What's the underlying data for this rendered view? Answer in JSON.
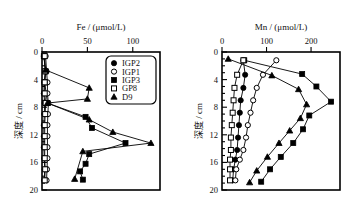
{
  "figure": {
    "panels": [
      {
        "id": "fe",
        "x_axis_title": "Fe / (μmol/L)",
        "y_axis_title": "深度 / cm",
        "x_ticks": [
          0,
          50,
          100
        ],
        "x_range": [
          0,
          130
        ],
        "y_ticks": [
          0,
          4,
          8,
          12,
          16,
          20
        ],
        "y_range": [
          0,
          20
        ],
        "has_legend": true
      },
      {
        "id": "mn",
        "x_axis_title": "Mn / (μmol/L)",
        "y_axis_title": "深度 / cm",
        "x_ticks": [
          0,
          100,
          200
        ],
        "x_range": [
          0,
          265
        ],
        "y_ticks": [
          0,
          4,
          8,
          12,
          16,
          20
        ],
        "has_legend": false
      }
    ]
  },
  "legend": {
    "entries": [
      {
        "label": "IGP2",
        "marker": "filled-circle"
      },
      {
        "label": "IGP1",
        "marker": "open-circle"
      },
      {
        "label": "IGP3",
        "marker": "filled-square"
      },
      {
        "label": "GP8",
        "marker": "open-square"
      },
      {
        "label": "D9",
        "marker": "filled-triangle"
      }
    ]
  },
  "chart_data": [
    {
      "type": "line",
      "id": "fe-profile",
      "title": "Fe / (μmol/L)",
      "xlabel": "Fe / (μmol/L)",
      "ylabel": "深度 / cm",
      "xlim": [
        0,
        130
      ],
      "ylim": [
        20,
        0
      ],
      "y_inverted": true,
      "grid": false,
      "legend_position": "top-right",
      "x_ticks": [
        0,
        50,
        100
      ],
      "y_ticks": [
        0,
        4,
        8,
        12,
        16,
        20
      ],
      "series": [
        {
          "name": "IGP2",
          "marker": "filled-circle",
          "depth_cm": [
            0.6,
            2.8,
            4.4,
            6.0,
            7.4,
            9.0,
            10.6,
            12.2,
            13.8,
            15.4,
            17.0,
            18.6
          ],
          "values": [
            2.0,
            4.0,
            2.5,
            2.0,
            3.0,
            2.5,
            2.0,
            2.0,
            2.0,
            2.5,
            3.0,
            2.5
          ]
        },
        {
          "name": "IGP1",
          "marker": "open-circle",
          "depth_cm": [
            0.6,
            2.8,
            4.4,
            6.0,
            7.4,
            9.0,
            10.6,
            12.2,
            13.8,
            15.4,
            17.0,
            18.6
          ],
          "values": [
            4.0,
            5.0,
            6.0,
            6.0,
            7.0,
            6.5,
            6.0,
            6.0,
            6.0,
            6.0,
            5.5,
            5.0
          ]
        },
        {
          "name": "IGP3",
          "marker": "filled-square",
          "depth_cm": [
            0.6,
            2.8,
            4.4,
            7.4,
            9.4,
            11.0,
            13.2,
            14.8,
            16.2,
            17.3,
            18.5
          ],
          "values": [
            2.0,
            4.0,
            3.0,
            6.0,
            48.0,
            55.0,
            92.0,
            52.0,
            48.0,
            42.0,
            45.0
          ]
        },
        {
          "name": "GP8",
          "marker": "open-square",
          "depth_cm": [
            0.6,
            2.8,
            4.4,
            6.0,
            7.4,
            9.0,
            10.6,
            12.2,
            13.8,
            15.4,
            17.0,
            18.6
          ],
          "values": [
            3.0,
            3.5,
            3.0,
            3.0,
            4.0,
            3.5,
            3.0,
            3.0,
            3.0,
            3.0,
            3.5,
            3.0
          ]
        },
        {
          "name": "D9",
          "marker": "filled-triangle",
          "depth_cm": [
            2.6,
            5.2,
            6.8,
            7.4,
            9.8,
            11.6,
            13.2,
            14.4,
            18.4
          ],
          "values": [
            4.0,
            52.0,
            50.0,
            6.0,
            52.0,
            78.0,
            120.0,
            45.0,
            36.0
          ]
        }
      ]
    },
    {
      "type": "line",
      "id": "mn-profile",
      "title": "Mn / (μmol/L)",
      "xlabel": "Mn / (μmol/L)",
      "ylabel": "深度 / cm",
      "xlim": [
        0,
        265
      ],
      "ylim": [
        20,
        0
      ],
      "y_inverted": true,
      "grid": false,
      "legend_position": "none",
      "x_ticks": [
        0,
        100,
        200
      ],
      "y_ticks": [
        0,
        4,
        8,
        12,
        16,
        20
      ],
      "series": [
        {
          "name": "IGP2",
          "marker": "filled-circle",
          "depth_cm": [
            1.2,
            3.3,
            5.2,
            7.0,
            8.8,
            10.6,
            12.4,
            14.2,
            15.6,
            17.0,
            18.6
          ],
          "values": [
            48.0,
            52.0,
            48.0,
            42.0,
            40.0,
            38.0,
            36.0,
            34.0,
            30.0,
            26.0,
            24.0
          ]
        },
        {
          "name": "IGP1",
          "marker": "open-circle",
          "depth_cm": [
            1.2,
            3.3,
            5.2,
            7.0,
            8.8,
            10.6,
            12.4,
            14.2,
            15.6,
            17.0,
            18.6
          ],
          "values": [
            122.0,
            92.0,
            78.0,
            70.0,
            64.0,
            58.0,
            54.0,
            48.0,
            40.0,
            32.0,
            30.0
          ]
        },
        {
          "name": "IGP3",
          "marker": "filled-square",
          "depth_cm": [
            1.2,
            3.2,
            5.0,
            7.2,
            9.2,
            11.2,
            13.2,
            15.2,
            17.0,
            18.8
          ],
          "values": [
            50.0,
            180.0,
            212.0,
            245.0,
            196.0,
            182.0,
            160.0,
            132.0,
            108.0,
            88.0
          ]
        },
        {
          "name": "GP8",
          "marker": "open-square",
          "depth_cm": [
            1.2,
            3.3,
            5.2,
            7.0,
            8.8,
            10.6,
            12.4,
            14.2,
            15.6,
            17.0,
            18.6
          ],
          "values": [
            48.0,
            34.0,
            28.0,
            26.0,
            24.0,
            22.0,
            20.0,
            20.0,
            18.0,
            18.0,
            18.0
          ]
        },
        {
          "name": "D9",
          "marker": "filled-triangle",
          "depth_cm": [
            1.0,
            3.4,
            5.4,
            7.6,
            9.6,
            11.4,
            13.2,
            15.2,
            17.2,
            18.9
          ],
          "values": [
            14.0,
            112.0,
            172.0,
            190.0,
            176.0,
            152.0,
            128.0,
            102.0,
            78.0,
            62.0
          ]
        }
      ]
    }
  ]
}
